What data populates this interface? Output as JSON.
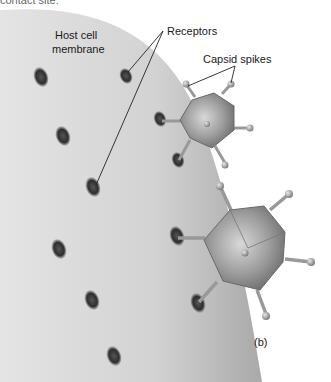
{
  "figure": {
    "panel_label": "(b)",
    "cut_text": "contact site.",
    "labels": {
      "host_membrane_line1": "Host cell",
      "host_membrane_line2": "membrane",
      "receptors": "Receptors",
      "capsid_spikes": "Capsid spikes"
    }
  },
  "colors": {
    "membrane_light": "#e6e6e6",
    "membrane_dark": "#a8a8a8",
    "receptor": "#3a3a3a",
    "capsid": "#8c8c8c",
    "spike": "#9a9a9a",
    "background": "#ffffff"
  }
}
